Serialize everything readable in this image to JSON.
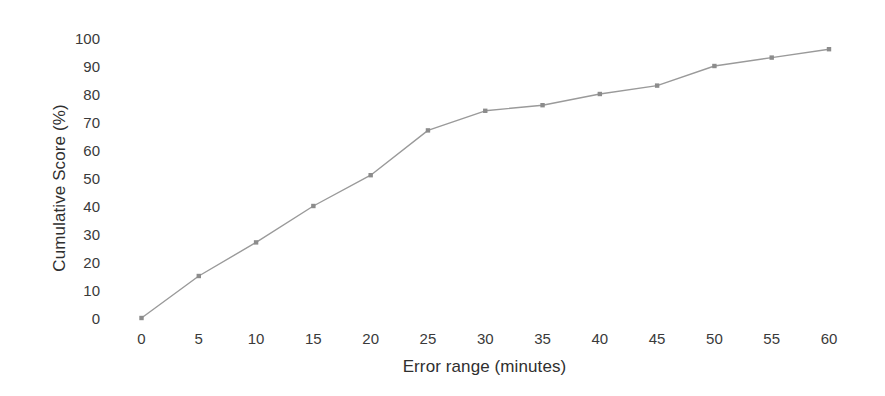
{
  "chart_data": {
    "type": "line",
    "title": "",
    "xlabel": "Error range (minutes)",
    "ylabel": "Cumulative Score (%)",
    "x": [
      0,
      5,
      10,
      15,
      20,
      25,
      30,
      35,
      40,
      45,
      50,
      55,
      60
    ],
    "values": [
      0,
      15,
      27,
      40,
      51,
      67,
      74,
      76,
      80,
      83,
      90,
      93,
      96
    ],
    "series": [
      {
        "name": "Cumulative Score",
        "values": [
          0,
          15,
          27,
          40,
          51,
          67,
          74,
          76,
          80,
          83,
          90,
          93,
          96
        ]
      }
    ],
    "xlim": [
      0,
      60
    ],
    "ylim": [
      0,
      100
    ],
    "xticks": [
      0,
      5,
      10,
      15,
      20,
      25,
      30,
      35,
      40,
      45,
      50,
      55,
      60
    ],
    "yticks": [
      0,
      10,
      20,
      30,
      40,
      50,
      60,
      70,
      80,
      90,
      100
    ],
    "xtick_labels": [
      "0",
      "5",
      "10",
      "15",
      "20",
      "25",
      "30",
      "35",
      "40",
      "45",
      "50",
      "55",
      "60"
    ],
    "ytick_labels": [
      "0",
      "10",
      "20",
      "30",
      "40",
      "50",
      "60",
      "70",
      "80",
      "90",
      "100"
    ],
    "grid": false,
    "legend": false,
    "legend_position": "none",
    "marker": "square",
    "line_color": "#9a9a9a",
    "marker_color": "#8c8c8c",
    "background_color": "#ffffff",
    "text_color": "#3a3a3a"
  }
}
